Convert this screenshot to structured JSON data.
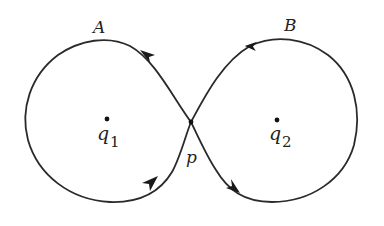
{
  "diagram": {
    "stroke_color": "#2a2a2a",
    "labels": {
      "loop_a": "A",
      "loop_b": "B",
      "crossing": "p",
      "charge1_base": "q",
      "charge1_sub": "1",
      "charge2_base": "q",
      "charge2_sub": "2"
    },
    "points": {
      "p": [
        191,
        122
      ],
      "q1": [
        107,
        119
      ],
      "q2": [
        277,
        120
      ]
    },
    "arrows": [
      {
        "location": "upper-left branch near A",
        "direction": "up-left"
      },
      {
        "location": "upper-right branch near B",
        "direction": "left"
      },
      {
        "location": "lower-left branch",
        "direction": "up-right"
      },
      {
        "location": "lower-right branch",
        "direction": "down-right"
      }
    ]
  }
}
